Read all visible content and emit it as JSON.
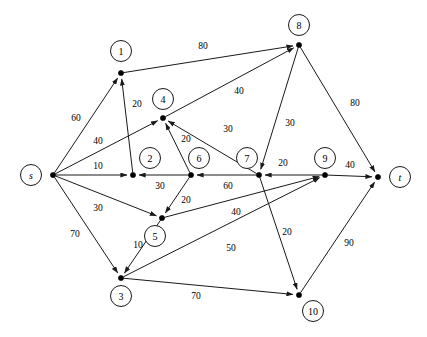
{
  "diagram": {
    "type": "directed-graph",
    "width": 427,
    "height": 337,
    "background_color": "#ffffff",
    "stroke_color": "#1a1a1a",
    "nodes": [
      {
        "id": "s",
        "label": "s",
        "x": 53,
        "y": 175,
        "label_x": 31,
        "label_y": 175,
        "italic": true
      },
      {
        "id": "1",
        "label": "1",
        "x": 121,
        "y": 73,
        "label_x": 121,
        "label_y": 51,
        "italic": false
      },
      {
        "id": "2",
        "label": "2",
        "x": 133,
        "y": 175,
        "label_x": 150,
        "label_y": 158,
        "italic": false
      },
      {
        "id": "3",
        "label": "3",
        "x": 121,
        "y": 278,
        "label_x": 121,
        "label_y": 296,
        "italic": false
      },
      {
        "id": "4",
        "label": "4",
        "x": 163,
        "y": 118,
        "label_x": 163,
        "label_y": 99,
        "italic": false
      },
      {
        "id": "5",
        "label": "5",
        "x": 162,
        "y": 218,
        "label_x": 155,
        "label_y": 236,
        "italic": false
      },
      {
        "id": "6",
        "label": "6",
        "x": 191,
        "y": 175,
        "label_x": 199,
        "label_y": 158,
        "italic": false
      },
      {
        "id": "7",
        "label": "7",
        "x": 259,
        "y": 175,
        "label_x": 247,
        "label_y": 158,
        "italic": false
      },
      {
        "id": "8",
        "label": "8",
        "x": 299,
        "y": 45,
        "label_x": 299,
        "label_y": 25,
        "italic": false
      },
      {
        "id": "9",
        "label": "9",
        "x": 325,
        "y": 175,
        "label_x": 325,
        "label_y": 158,
        "italic": false
      },
      {
        "id": "10",
        "label": "10",
        "x": 299,
        "y": 295,
        "label_x": 313,
        "label_y": 311,
        "italic": false
      },
      {
        "id": "t",
        "label": "t",
        "x": 378,
        "y": 177,
        "label_x": 400,
        "label_y": 177,
        "italic": true
      }
    ],
    "edges": [
      {
        "from": "s",
        "to": "1",
        "weight": 60,
        "label_x": 76,
        "label_y": 118
      },
      {
        "from": "s",
        "to": "4",
        "weight": 40,
        "label_x": 98,
        "label_y": 141
      },
      {
        "from": "s",
        "to": "2",
        "weight": 10,
        "label_x": 98,
        "label_y": 166
      },
      {
        "from": "s",
        "to": "5",
        "weight": 30,
        "label_x": 98,
        "label_y": 208
      },
      {
        "from": "s",
        "to": "3",
        "weight": 70,
        "label_x": 75,
        "label_y": 234
      },
      {
        "from": "1",
        "to": "8",
        "weight": 80,
        "label_x": 203,
        "label_y": 46
      },
      {
        "from": "2",
        "to": "1",
        "weight": 20,
        "label_x": 137,
        "label_y": 104
      },
      {
        "from": "4",
        "to": "8",
        "weight": 40,
        "label_x": 239,
        "label_y": 91
      },
      {
        "from": "6",
        "to": "4",
        "weight": 20,
        "label_x": 186,
        "label_y": 139
      },
      {
        "from": "7",
        "to": "4",
        "weight": 30,
        "label_x": 228,
        "label_y": 129
      },
      {
        "from": "6",
        "to": "2",
        "weight": 30,
        "label_x": 160,
        "label_y": 186
      },
      {
        "from": "7",
        "to": "6",
        "weight": 60,
        "label_x": 228,
        "label_y": 186
      },
      {
        "from": "6",
        "to": "5",
        "weight": 20,
        "label_x": 186,
        "label_y": 200
      },
      {
        "from": "9",
        "to": "7",
        "weight": 20,
        "label_x": 283,
        "label_y": 163
      },
      {
        "from": "9",
        "to": "t",
        "weight": 40,
        "label_x": 350,
        "label_y": 165
      },
      {
        "from": "8",
        "to": "7",
        "weight": 30,
        "label_x": 290,
        "label_y": 123
      },
      {
        "from": "8",
        "to": "t",
        "weight": 80,
        "label_x": 355,
        "label_y": 103
      },
      {
        "from": "5",
        "to": "9",
        "weight": 40,
        "label_x": 236,
        "label_y": 212
      },
      {
        "from": "3",
        "to": "9",
        "weight": 50,
        "label_x": 231,
        "label_y": 248
      },
      {
        "from": "5",
        "to": "3",
        "weight": 10,
        "label_x": 138,
        "label_y": 245
      },
      {
        "from": "3",
        "to": "10",
        "weight": 70,
        "label_x": 196,
        "label_y": 296
      },
      {
        "from": "7",
        "to": "10",
        "weight": 20,
        "label_x": 287,
        "label_y": 232
      },
      {
        "from": "10",
        "to": "t",
        "weight": 90,
        "label_x": 349,
        "label_y": 243
      }
    ]
  }
}
